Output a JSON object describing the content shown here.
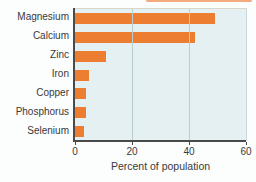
{
  "chart_data": {
    "type": "bar",
    "orientation": "horizontal",
    "title": "",
    "categories": [
      "Magnesium",
      "Calcium",
      "Zinc",
      "Iron",
      "Copper",
      "Phosphorus",
      "Selenium"
    ],
    "values": [
      49,
      42,
      11,
      5,
      4,
      4,
      3
    ],
    "xlabel": "Percent of population",
    "ylabel": "",
    "xlim": [
      0,
      60
    ],
    "xticks": [
      0,
      20,
      40,
      60
    ],
    "gridlines_at": [
      20,
      40
    ],
    "grid": "vertical",
    "legend": "none"
  },
  "colors": {
    "bar": "#ED7D31",
    "plot_bg": "#E5F0F3",
    "gridline": "#BCCDD1",
    "axis": "#4A4A4A",
    "text": "#3A3A3A",
    "top_stripe": "#F29B66"
  }
}
